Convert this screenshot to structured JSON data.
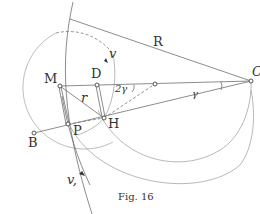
{
  "figure": {
    "caption": "Fig. 16",
    "points": {
      "M": {
        "label": "M",
        "x": 60,
        "y": 86
      },
      "D": {
        "label": "D",
        "x": 97,
        "y": 85
      },
      "C": {
        "label": "",
        "x": 155,
        "y": 84
      },
      "O": {
        "label": "O",
        "x": 251,
        "y": 81
      },
      "H": {
        "label": "H",
        "x": 104,
        "y": 118
      },
      "P": {
        "label": "P",
        "x": 68,
        "y": 124
      },
      "B": {
        "label": "B",
        "x": 34,
        "y": 133
      }
    },
    "labels": {
      "R": "R",
      "r": "r",
      "v": "v",
      "v1": "v,",
      "two_gamma": "2γ",
      "gamma": "γ"
    }
  }
}
